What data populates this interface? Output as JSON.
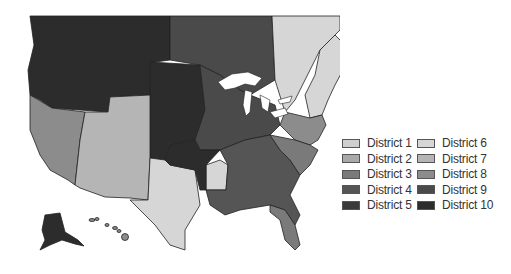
{
  "map": {
    "title": "",
    "regions": [
      {
        "name": "Canada Northwest / Pacific NW / Northern Rockies",
        "district": 10
      },
      {
        "name": "Canada Prairie / Plains north",
        "district": 9
      },
      {
        "name": "Canada East / Quebec",
        "district": 6
      },
      {
        "name": "New England",
        "district": 6
      },
      {
        "name": "California / Nevada",
        "district": 8
      },
      {
        "name": "Southwest / Colorado / Wyoming",
        "district": 7
      },
      {
        "name": "Texas / Arkansas",
        "district": 6
      },
      {
        "name": "Great Plains",
        "district": 10
      },
      {
        "name": "Midwest / Great Lakes",
        "district": 9
      },
      {
        "name": "Mid-Atlantic / NY / PA",
        "district": 8
      },
      {
        "name": "Southeast",
        "district": 4
      },
      {
        "name": "Carolinas / Virginia",
        "district": 3
      },
      {
        "name": "Alaska",
        "district": 10
      },
      {
        "name": "Hawaii",
        "district": 8
      }
    ]
  },
  "legend": {
    "items": [
      {
        "label": "District 1",
        "color": "#cfcfcf"
      },
      {
        "label": "District 6",
        "color": "#d6d6d6"
      },
      {
        "label": "District 2",
        "color": "#a9a9a9"
      },
      {
        "label": "District 7",
        "color": "#b5b5b5"
      },
      {
        "label": "District 3",
        "color": "#7a7a7a"
      },
      {
        "label": "District 8",
        "color": "#8c8c8c"
      },
      {
        "label": "District 4",
        "color": "#555555"
      },
      {
        "label": "District 9",
        "color": "#4a4a4a"
      },
      {
        "label": "District 5",
        "color": "#3a3a3a"
      },
      {
        "label": "District 10",
        "color": "#2c2c2c"
      }
    ]
  },
  "colors": {
    "d1": "#cfcfcf",
    "d2": "#a9a9a9",
    "d3": "#7a7a7a",
    "d4": "#555555",
    "d5": "#3a3a3a",
    "d6": "#d6d6d6",
    "d7": "#b5b5b5",
    "d8": "#8c8c8c",
    "d9": "#4a4a4a",
    "d10": "#2c2c2c",
    "water": "#ffffff",
    "border": "#222222"
  }
}
